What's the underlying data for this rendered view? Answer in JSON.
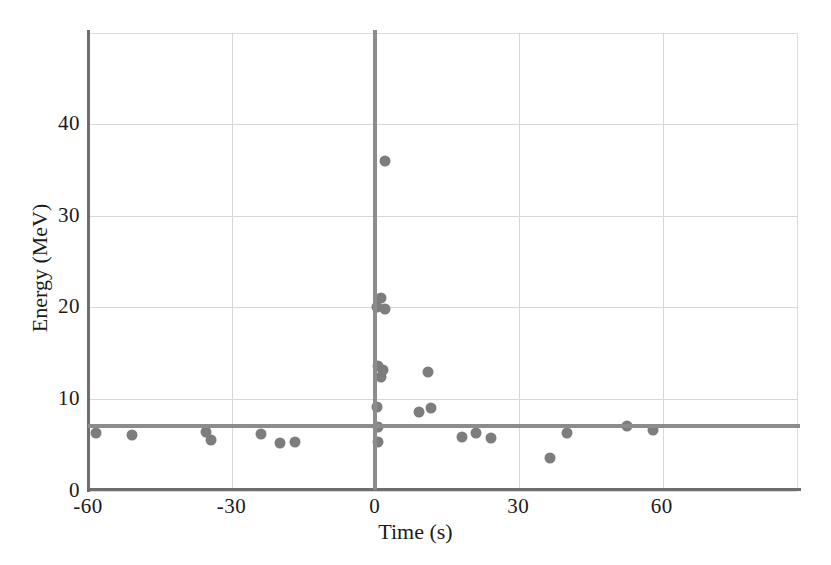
{
  "chart_data": {
    "type": "scatter",
    "title": "",
    "xlabel": "Time (s)",
    "ylabel": "Energy (MeV)",
    "xlim": [
      -60,
      88.5
    ],
    "ylim": [
      0,
      49.8
    ],
    "xticks": [
      -60,
      -30,
      0,
      30,
      60
    ],
    "xticklabels": [
      "-60",
      "-30",
      "0",
      "30",
      "60"
    ],
    "yticks": [
      0,
      10,
      20,
      30,
      40
    ],
    "yticklabels": [
      "0",
      "10",
      "20",
      "30",
      "40"
    ],
    "grid": true,
    "legend": "none",
    "marker_color": "#7d7d7d",
    "reference_lines": [
      {
        "name": "vertical-trigger-time",
        "orientation": "vertical",
        "value": 0,
        "color": "#8c8c8c"
      },
      {
        "name": "horizontal-energy-threshold",
        "orientation": "horizontal",
        "value": 7.0,
        "color": "#8c8c8c"
      }
    ],
    "points": [
      {
        "x": -58.5,
        "y": 6.3
      },
      {
        "x": -51.0,
        "y": 6.1
      },
      {
        "x": -35.5,
        "y": 6.4
      },
      {
        "x": -34.5,
        "y": 5.6
      },
      {
        "x": -24.0,
        "y": 6.2
      },
      {
        "x": -20.0,
        "y": 5.2
      },
      {
        "x": -17.0,
        "y": 5.3
      },
      {
        "x": 2.0,
        "y": 36.0
      },
      {
        "x": 1.0,
        "y": 21.0
      },
      {
        "x": 0.3,
        "y": 20.1
      },
      {
        "x": 2.0,
        "y": 19.8
      },
      {
        "x": 0.5,
        "y": 13.6
      },
      {
        "x": 1.5,
        "y": 13.2
      },
      {
        "x": 1.0,
        "y": 12.4
      },
      {
        "x": 11.0,
        "y": 13.0
      },
      {
        "x": 0.3,
        "y": 9.1
      },
      {
        "x": 9.0,
        "y": 8.6
      },
      {
        "x": 11.5,
        "y": 9.0
      },
      {
        "x": 0.5,
        "y": 7.0
      },
      {
        "x": 0.5,
        "y": 5.3
      },
      {
        "x": 18.0,
        "y": 5.9
      },
      {
        "x": 21.0,
        "y": 6.3
      },
      {
        "x": 24.0,
        "y": 5.8
      },
      {
        "x": 36.5,
        "y": 3.6
      },
      {
        "x": 40.0,
        "y": 6.3
      },
      {
        "x": 52.5,
        "y": 7.1
      },
      {
        "x": 58.0,
        "y": 6.6
      }
    ]
  }
}
